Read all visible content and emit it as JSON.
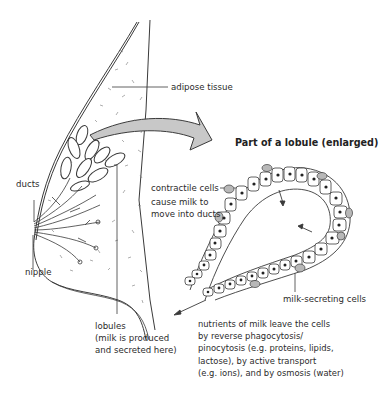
{
  "figure": {
    "enlarged_title": "Part of a lobule (enlarged)"
  },
  "labels": {
    "adipose": "adipose tissue",
    "ducts": "ducts",
    "nipple": "nipple",
    "contractile_1": "contractile cells",
    "contractile_2": "cause milk to",
    "contractile_3": "move into ducts",
    "milk_secreting": "milk-secreting cells",
    "lobules_1": "lobules",
    "lobules_2": "(milk is produced",
    "lobules_3": "and secreted here)"
  },
  "note": {
    "lines": [
      "nutrients of milk leave the cells",
      "by reverse phagocytosis/",
      "pinocytosis (e.g. proteins, lipids,",
      "lactose), by active transport",
      "(e.g. ions), and by osmosis (water)"
    ]
  },
  "colors": {
    "line": "#3a3a3a",
    "arrow_fill": "#c8c8c8",
    "contractile_fill": "#b8b8b8",
    "background": "#ffffff"
  }
}
